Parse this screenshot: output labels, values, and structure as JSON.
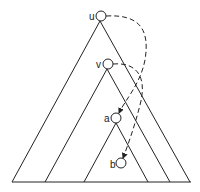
{
  "diagram": {
    "type": "nested-subtree-triangles",
    "nodes": [
      {
        "id": "u",
        "label": "u"
      },
      {
        "id": "v",
        "label": "v"
      },
      {
        "id": "a",
        "label": "a"
      },
      {
        "id": "b",
        "label": "b"
      }
    ],
    "edges": [
      {
        "from": "u",
        "to": "a",
        "style": "dashed",
        "arrow": true
      },
      {
        "from": "v",
        "to": "b",
        "style": "dashed",
        "arrow": true
      }
    ],
    "colors": {
      "stroke": "#222222",
      "background": "#ffffff"
    }
  }
}
